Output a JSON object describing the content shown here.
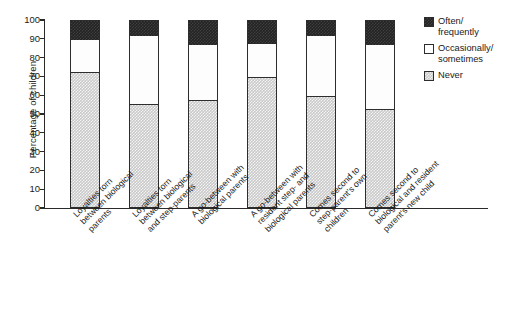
{
  "chart_data": {
    "type": "bar",
    "subtype": "stacked-bar-100-percent",
    "title": "",
    "xlabel": "",
    "ylabel": "Percentage of children",
    "ylim": [
      0,
      100
    ],
    "ytick_step": 10,
    "yticks": [
      100,
      90,
      80,
      70,
      60,
      50,
      40,
      30,
      20,
      10,
      0
    ],
    "grid": false,
    "legend_position": "right",
    "categories": [
      "Loyalties torn between biological parents",
      "Loyalties torn between biological and step-parents",
      "A go-between with biological parents",
      "A go-between with resident step- and biological parents",
      "Comes second to step-parent's own children",
      "Comes second to biological and resident parent's new child"
    ],
    "series": [
      {
        "name": "Never",
        "color": "#c9c9c9",
        "values": [
          72,
          55,
          57,
          69,
          59,
          52
        ]
      },
      {
        "name": "Occasionally/sometimes",
        "color": "#ffffff",
        "values": [
          18,
          37,
          30,
          19,
          33,
          35
        ]
      },
      {
        "name": "Often/frequently",
        "color": "#232323",
        "values": [
          10,
          8,
          13,
          12,
          8,
          13
        ]
      }
    ],
    "cumulative_tops": [
      {
        "never": 72,
        "never_plus_occasional": 90,
        "total": 100
      },
      {
        "never": 55,
        "never_plus_occasional": 92,
        "total": 100
      },
      {
        "never": 57,
        "never_plus_occasional": 87,
        "total": 100
      },
      {
        "never": 69,
        "never_plus_occasional": 88,
        "total": 100
      },
      {
        "never": 59,
        "never_plus_occasional": 92,
        "total": 100
      },
      {
        "never": 52,
        "never_plus_occasional": 87,
        "total": 100
      }
    ]
  },
  "axes": {
    "y_title": "Percentage of children",
    "y_labels": [
      "100",
      "90",
      "80",
      "70",
      "60",
      "50",
      "40",
      "30",
      "20",
      "10",
      "0"
    ]
  },
  "x_labels": [
    "Loyalties torn\nbetween biological\nparents",
    "Loyalties torn\nbetween biological\nand step-parents",
    "A go-between with\nbiological parents",
    "A go-between with\nresident step- and\nbiological parents",
    "Comes second to\nstep-parent's own\nchildren",
    "Comes second to\nbiological and resident\nparent's new child"
  ],
  "legend": {
    "items": [
      {
        "label": "Often/\nfrequently",
        "swatch": "often-swatch"
      },
      {
        "label": "Occasionally/\nsometimes",
        "swatch": "occasionally-swatch"
      },
      {
        "label": "Never",
        "swatch": "never-swatch"
      }
    ]
  }
}
